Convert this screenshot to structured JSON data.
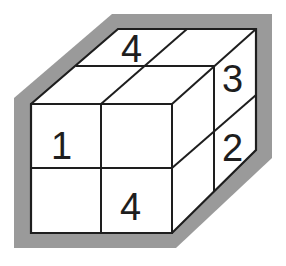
{
  "diagram": {
    "type": "cube-net-puzzle",
    "colors": {
      "outline": "#9a9a9a",
      "lines": "#1e1e1e",
      "face": "#ffffff"
    },
    "labels": {
      "top_back_left": "4",
      "right_top_back": "3",
      "front_top_left": "1",
      "right_bottom_back": "2",
      "front_bottom_right": "4"
    }
  }
}
